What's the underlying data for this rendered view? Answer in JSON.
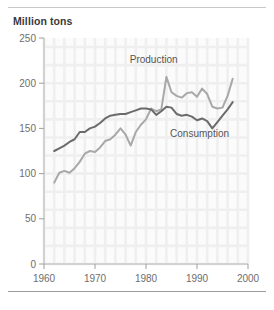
{
  "figure": {
    "axis_title": "Million tons",
    "source_note": "",
    "rules": {
      "top_color": "#c9c9c9",
      "bottom_color": "#9a9a9a"
    }
  },
  "chart_data": {
    "type": "line",
    "title": "",
    "subtitle": "",
    "xlabel": "",
    "ylabel": "Million tons",
    "xlim": [
      1960,
      2000
    ],
    "ylim": [
      0,
      250
    ],
    "xticks": [
      1960,
      1970,
      1980,
      1990,
      2000
    ],
    "xticklabels": [
      "1960",
      "1970",
      "1980",
      "1990",
      "2000"
    ],
    "yticks": [
      0,
      50,
      100,
      150,
      200,
      250
    ],
    "yticklabels": [
      "0",
      "50",
      "100",
      "150",
      "200",
      "250"
    ],
    "grid": true,
    "grid_style": "light checkered background grid",
    "legend": "inline annotations",
    "annotations": [
      {
        "text": "Production",
        "x": 1981.5,
        "y": 222,
        "series": "Production"
      },
      {
        "text": "Consumption",
        "x": 1990.5,
        "y": 140,
        "series": "Consumption"
      }
    ],
    "series": [
      {
        "name": "Production",
        "color": "#a8a8a8",
        "x": [
          1962,
          1963,
          1964,
          1965,
          1966,
          1967,
          1968,
          1969,
          1970,
          1971,
          1972,
          1973,
          1974,
          1975,
          1976,
          1977,
          1978,
          1979,
          1980,
          1981,
          1982,
          1983,
          1984,
          1985,
          1986,
          1987,
          1988,
          1989,
          1990,
          1991,
          1992,
          1993,
          1994,
          1995,
          1996,
          1997
        ],
        "values": [
          90,
          101,
          103,
          101,
          106,
          113,
          122,
          125,
          124,
          129,
          136,
          138,
          143,
          150,
          143,
          131,
          146,
          154,
          160,
          172,
          169,
          171,
          207,
          190,
          186,
          184,
          189,
          190,
          185,
          194,
          188,
          174,
          172,
          173,
          186,
          205
        ]
      },
      {
        "name": "Consumption",
        "color": "#6b6b6b",
        "x": [
          1962,
          1963,
          1964,
          1965,
          1966,
          1967,
          1968,
          1969,
          1970,
          1971,
          1972,
          1973,
          1974,
          1975,
          1976,
          1977,
          1978,
          1979,
          1980,
          1981,
          1982,
          1983,
          1984,
          1985,
          1986,
          1987,
          1988,
          1989,
          1990,
          1991,
          1992,
          1993,
          1994,
          1995,
          1996,
          1997
        ],
        "values": [
          125,
          128,
          131,
          135,
          138,
          146,
          146,
          150,
          152,
          156,
          161,
          164,
          165,
          166,
          166,
          168,
          170,
          172,
          172,
          171,
          165,
          169,
          174,
          173,
          166,
          164,
          165,
          163,
          159,
          161,
          158,
          150,
          157,
          164,
          171,
          179
        ]
      }
    ]
  }
}
